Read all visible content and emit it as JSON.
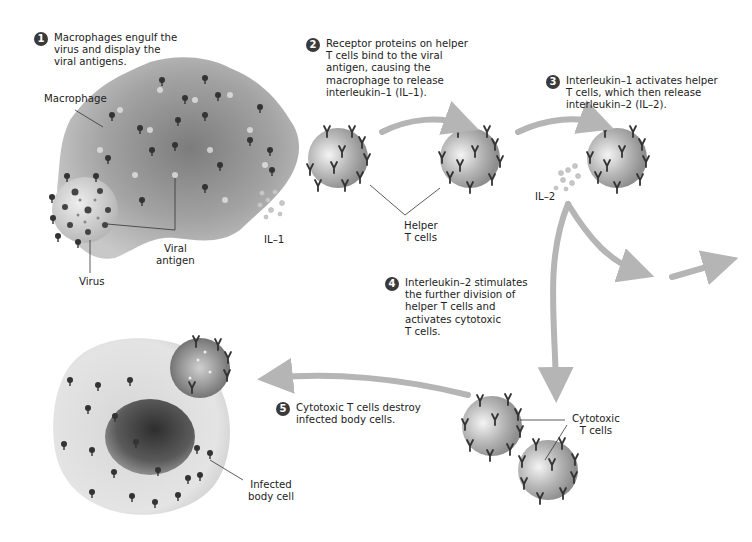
{
  "steps": [
    {
      "number": "1",
      "text": "Macrophages engulf the\nvirus and display the\nviral antigens."
    },
    {
      "number": "2",
      "text": "Receptor proteins on helper\nT cells bind to the viral\nantigen, causing the\nmacrophage to release\ninterleukin–1 (IL–1)."
    },
    {
      "number": "3",
      "text": "Interleukin–1 activates helper\nT cells, which then release\ninterleukin–2 (IL–2)."
    },
    {
      "number": "4",
      "text": "Interleukin–2 stimulates\nthe further division of\nhelper T cells and\nactivates cytotoxic\nT cells."
    },
    {
      "number": "5",
      "text": "Cytotoxic T cells destroy\ninfected body cells."
    }
  ],
  "labels": {
    "macrophage": "Macrophage",
    "viral_antigen": "Viral\nantigen",
    "virus": "Virus",
    "il1": "IL–1",
    "helper_t_cells": "Helper\nT cells",
    "il2": "IL–2",
    "cytotoxic_t_cells": "Cytotoxic\nT cells",
    "infected_body_cell": "Infected\nbody cell"
  },
  "colors": {
    "arrow": "#b5b5b5",
    "macrophage": "#9a9a9a",
    "t_cell": "#a8a8a8",
    "body_cell": "#dcdcdc",
    "nucleus": "#555555",
    "step_badge": "#3a3a3a"
  }
}
